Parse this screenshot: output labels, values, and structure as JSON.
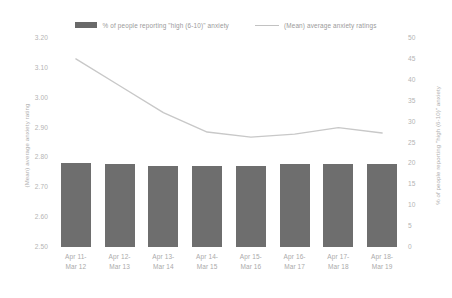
{
  "chart_data": {
    "type": "bar",
    "title": "",
    "subtitle": "",
    "xlabel": "",
    "categories": [
      "Apr 11-\nMar 12",
      "Apr 12-\nMar 13",
      "Apr 13-\nMar 14",
      "Apr 14-\nMar 15",
      "Apr 15-\nMar 16",
      "Apr 16-\nMar 17",
      "Apr 17-\nMar 18",
      "Apr 18-\nMar 19"
    ],
    "category_lines": [
      [
        "Apr 11-",
        "Mar 12"
      ],
      [
        "Apr 12-",
        "Mar 13"
      ],
      [
        "Apr 13-",
        "Mar 14"
      ],
      [
        "Apr 14-",
        "Mar 15"
      ],
      [
        "Apr 15-",
        "Mar 16"
      ],
      [
        "Apr 16-",
        "Mar 17"
      ],
      [
        "Apr 17-",
        "Mar 18"
      ],
      [
        "Apr 18-",
        "Mar 19"
      ]
    ],
    "series": [
      {
        "name": "% of people reporting \"high (6-10)\" anxiety",
        "type": "bar",
        "axis": "right",
        "color": "#4a4a4a",
        "values": [
          20.0,
          19.8,
          19.5,
          19.3,
          19.5,
          19.8,
          19.8,
          19.8
        ]
      },
      {
        "name": "(Mean) average anxiety ratings",
        "type": "line",
        "axis": "left",
        "color": "#c8c8c8",
        "values": [
          3.13,
          3.04,
          2.95,
          2.885,
          2.868,
          2.878,
          2.9,
          2.882
        ]
      }
    ],
    "y_left": {
      "label": "(Mean) average anxiety rating",
      "min": 2.5,
      "max": 3.2,
      "step": 0.1,
      "ticks": [
        "3.20",
        "3.10",
        "3.00",
        "2.90",
        "2.80",
        "2.70",
        "2.60",
        "2.50"
      ]
    },
    "y_right": {
      "label": "% of people reporting \"high (6-10)\" anxiety",
      "min": 0,
      "max": 50,
      "step": 5,
      "ticks": [
        "50",
        "45",
        "40",
        "35",
        "30",
        "25",
        "20",
        "15",
        "10",
        "5",
        "0"
      ]
    },
    "grid": false,
    "legend_position": "top"
  },
  "legend": {
    "items": [
      {
        "label": "% of people reporting \"high (6-10)\" anxiety",
        "marker": "bar-swatch-icon"
      },
      {
        "label": "(Mean) average anxiety ratings",
        "marker": "line-swatch-icon"
      }
    ]
  }
}
